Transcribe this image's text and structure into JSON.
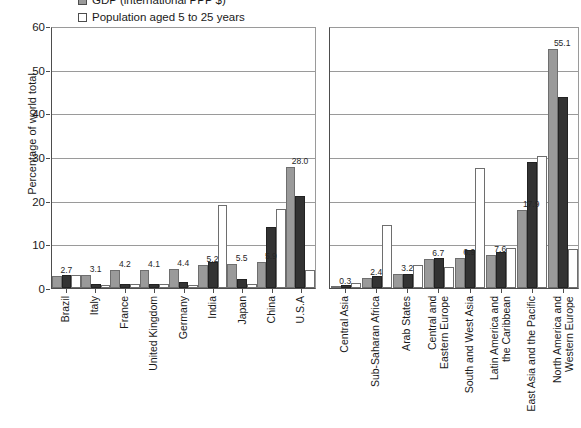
{
  "chart_data": {
    "type": "bar",
    "title": "",
    "xlabel": "",
    "ylabel": "Percentage of world total",
    "ylim": [
      0,
      60
    ],
    "yticks": [
      0,
      10,
      20,
      30,
      40,
      50,
      60
    ],
    "grid": true,
    "legend_position": "top-left",
    "colors": {
      "gdp": "#9a9a9a",
      "population": "#333333",
      "young": "#ffffff"
    },
    "legend": [
      {
        "label": "GDP (international PPP $)",
        "swatch": "gray"
      },
      {
        "label": "Population aged 5 to 25 years",
        "swatch": "white"
      }
    ],
    "series": [
      {
        "name": "GDP (international PPP $)",
        "key": "gdp"
      },
      {
        "name": "Population",
        "key": "pop"
      },
      {
        "name": "Population aged 5 to 25 years",
        "key": "young"
      }
    ],
    "panels": [
      {
        "name": "countries",
        "categories": [
          "Brazil",
          "Italy",
          "France",
          "United Kingdom",
          "Germany",
          "India",
          "Japan",
          "China",
          "U.S.A"
        ],
        "values": {
          "gdp": [
            2.7,
            3.1,
            4.2,
            4.1,
            4.4,
            5.2,
            5.5,
            5.9,
            28.0
          ],
          "pop": [
            2.9,
            0.9,
            1.0,
            1.0,
            1.3,
            6.1,
            2.1,
            14.1,
            21.2
          ],
          "young": [
            3.1,
            0.8,
            0.9,
            0.9,
            0.8,
            19.1,
            1.0,
            18.3,
            4.1
          ]
        },
        "labels": [
          "2.7",
          "3.1",
          "4.2",
          "4.1",
          "4.4",
          "5.2",
          "5.5",
          "5.9",
          "28.0"
        ]
      },
      {
        "name": "regions",
        "categories": [
          "Central Asia",
          "Sub-Saharan Africa",
          "Arab States",
          "Central and\nEastern Europe",
          "South and West Asia",
          "Latin America and\nthe Caribbean",
          "East Asia and the Pacific",
          "North America and\nWestern Europe"
        ],
        "values": {
          "gdp": [
            0.3,
            2.4,
            3.2,
            6.7,
            6.9,
            7.6,
            17.9,
            55.1
          ],
          "pop": [
            0.8,
            2.7,
            3.2,
            6.9,
            8.7,
            8.2,
            29.0,
            44.0
          ],
          "young": [
            1.1,
            14.5,
            5.2,
            4.9,
            27.7,
            9.2,
            30.5,
            9.0
          ]
        },
        "labels": [
          "0.3",
          "2.4",
          "3.2",
          "6.7",
          "6.9",
          "7.6",
          "17.9",
          "55.1"
        ]
      }
    ]
  }
}
